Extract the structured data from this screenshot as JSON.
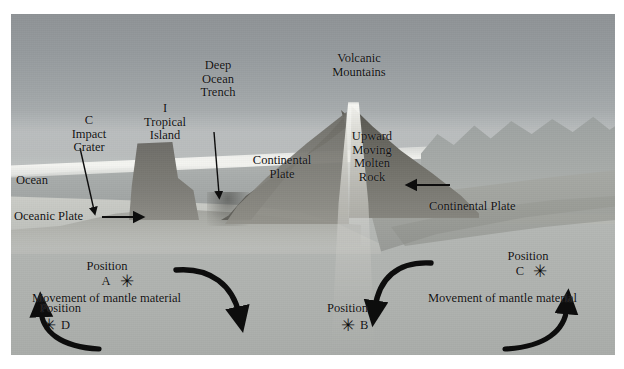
{
  "figure": {
    "background_color": "#ffffff",
    "plate_color": "#9a9a9a",
    "ink_color": "#111111"
  },
  "labels": {
    "impact_crater": "C\nImpact\nCrater",
    "tropical_island": "I\nTropical\nIsland",
    "deep_ocean_trench": "Deep\nOcean\nTrench",
    "volcanic_mountains": "Volcanic\nMountains",
    "continental_plate_left": "Continental\nPlate",
    "upward_moving_molten_rock": "Upward\nMoving\nMolten\nRock",
    "continental_plate_right": "Continental Plate",
    "ocean": "Ocean",
    "oceanic_plate": "Oceanic Plate",
    "movement_left": "Movement of mantle material",
    "movement_right": "Movement of mantle material"
  },
  "positions": [
    {
      "id": "A",
      "label": "Position",
      "letter": "A",
      "marker": "asterisk-marker",
      "marker_side": "right"
    },
    {
      "id": "B",
      "label": "Position",
      "letter": "B",
      "marker": "asterisk-marker",
      "marker_side": "left"
    },
    {
      "id": "C",
      "label": "Position",
      "letter": "C",
      "marker": "asterisk-marker",
      "marker_side": "right"
    },
    {
      "id": "D",
      "label": "Position",
      "letter": "D",
      "marker": "asterisk-marker",
      "marker_side": "left"
    }
  ],
  "arrows": [
    {
      "name": "impact-crater-pointer",
      "kind": "straight",
      "direction": "down"
    },
    {
      "name": "deep-ocean-trench-pointer",
      "kind": "straight",
      "direction": "down"
    },
    {
      "name": "oceanic-plate-motion",
      "kind": "straight",
      "direction": "right"
    },
    {
      "name": "continental-plate-motion",
      "kind": "straight",
      "direction": "left"
    },
    {
      "name": "mantle-convection-left-descending",
      "kind": "curved",
      "direction": "down"
    },
    {
      "name": "mantle-convection-left-ascending",
      "kind": "curved",
      "direction": "up"
    },
    {
      "name": "mantle-convection-right-descending",
      "kind": "curved",
      "direction": "down"
    },
    {
      "name": "mantle-convection-right-ascending",
      "kind": "curved",
      "direction": "up"
    }
  ]
}
